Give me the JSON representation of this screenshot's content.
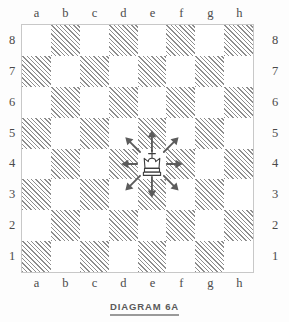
{
  "diagram": {
    "caption": "DIAGRAM 6A",
    "type": "chessboard",
    "orientation": "white-bottom"
  },
  "board": {
    "files": [
      "a",
      "b",
      "c",
      "d",
      "e",
      "f",
      "g",
      "h"
    ],
    "ranks": [
      "8",
      "7",
      "6",
      "5",
      "4",
      "3",
      "2",
      "1"
    ],
    "light_square_color": "#ffffff",
    "dark_square_color": "#8d8d8d",
    "dark_square_style": "diagonal-hatch",
    "border_color": "#c8c8c8",
    "a8_is_light": true
  },
  "pieces": [
    {
      "type": "king",
      "color": "white",
      "square": "e4",
      "file_index": 4,
      "rank_index": 4,
      "glyph": "white-king"
    }
  ],
  "arrows": {
    "origin_square": "e4",
    "color": "#5c5c5c",
    "items": [
      {
        "direction": "north",
        "label": "N",
        "target_square": "e5",
        "dx": 0,
        "dy": -1
      },
      {
        "direction": "northeast",
        "label": "NE",
        "target_square": "f5",
        "dx": 1,
        "dy": -1
      },
      {
        "direction": "east",
        "label": "E",
        "target_square": "f4",
        "dx": 1,
        "dy": 0
      },
      {
        "direction": "southeast",
        "label": "SE",
        "target_square": "f3",
        "dx": 1,
        "dy": 1
      },
      {
        "direction": "south",
        "label": "S",
        "target_square": "e3",
        "dx": 0,
        "dy": 1
      },
      {
        "direction": "southwest",
        "label": "SW",
        "target_square": "d3",
        "dx": -1,
        "dy": 1
      },
      {
        "direction": "west",
        "label": "W",
        "target_square": "d4",
        "dx": -1,
        "dy": 0
      },
      {
        "direction": "northwest",
        "label": "NW",
        "target_square": "d5",
        "dx": -1,
        "dy": -1
      }
    ]
  },
  "chart_data": {
    "type": "table",
    "title": "DIAGRAM 6A",
    "xlabel": "files",
    "ylabel": "ranks",
    "categories": [
      "a",
      "b",
      "c",
      "d",
      "e",
      "f",
      "g",
      "h"
    ],
    "rows": [
      "8",
      "7",
      "6",
      "5",
      "4",
      "3",
      "2",
      "1"
    ],
    "note": "King on e4 with eight move arrows to d5, e5, f5, d4, f4, d3, e3, f3"
  }
}
